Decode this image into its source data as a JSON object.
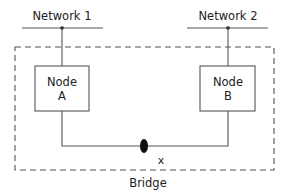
{
  "diagram": {
    "type": "network-bridge",
    "networks": [
      {
        "id": "net1",
        "label": "Network 1"
      },
      {
        "id": "net2",
        "label": "Network 2"
      }
    ],
    "nodes": [
      {
        "id": "nodeA",
        "line1": "Node",
        "line2": "A",
        "attached_to": "net1"
      },
      {
        "id": "nodeB",
        "line1": "Node",
        "line2": "B",
        "attached_to": "net2"
      }
    ],
    "link": {
      "from": "nodeA",
      "to": "nodeB",
      "point_label": "x"
    },
    "container": {
      "label": "Bridge",
      "style": "dashed"
    },
    "colors": {
      "stroke": "#444444",
      "text": "#222222",
      "background": "#ffffff"
    }
  }
}
